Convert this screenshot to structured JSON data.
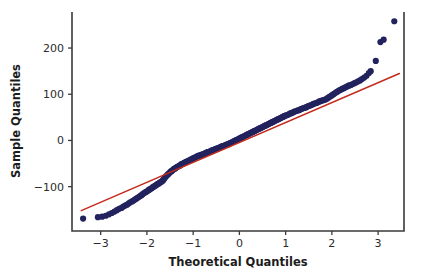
{
  "chart_data": {
    "type": "scatter",
    "title": "",
    "xlabel": "Theoretical Quantiles",
    "ylabel": "Sample Quantiles",
    "xlim": [
      -3.62,
      3.56
    ],
    "ylim": [
      -196,
      278
    ],
    "xticks": [
      -3,
      -2,
      -1,
      0,
      1,
      2,
      3
    ],
    "xticklabels": [
      "−3",
      "−2",
      "−1",
      "0",
      "1",
      "2",
      "3"
    ],
    "yticks": [
      -100,
      0,
      100,
      200
    ],
    "yticklabels": [
      "−100",
      "0",
      "100",
      "200"
    ],
    "grid": false,
    "legend": null,
    "series": [
      {
        "name": "sample-quantiles",
        "kind": "scatter",
        "marker": "circle",
        "marker_size": 5.0,
        "color": "#22225e",
        "points": [
          [
            -3.38,
            -169
          ],
          [
            -3.06,
            -166
          ],
          [
            -2.97,
            -165
          ],
          [
            -2.89,
            -163
          ],
          [
            -2.82,
            -160
          ],
          [
            -2.76,
            -157
          ],
          [
            -2.7,
            -154
          ],
          [
            -2.65,
            -151
          ],
          [
            -2.6,
            -148
          ],
          [
            -2.55,
            -146
          ],
          [
            -2.51,
            -143
          ],
          [
            -2.47,
            -141
          ],
          [
            -2.43,
            -139
          ],
          [
            -2.39,
            -136
          ],
          [
            -2.36,
            -134
          ],
          [
            -2.32,
            -132
          ],
          [
            -2.29,
            -130
          ],
          [
            -2.26,
            -128
          ],
          [
            -2.23,
            -126
          ],
          [
            -2.2,
            -124
          ],
          [
            -2.17,
            -122
          ],
          [
            -2.14,
            -120
          ],
          [
            -2.11,
            -118
          ],
          [
            -2.09,
            -116
          ],
          [
            -2.06,
            -114
          ],
          [
            -2.03,
            -112
          ],
          [
            -2.01,
            -111
          ],
          [
            -1.98,
            -109
          ],
          [
            -1.96,
            -107
          ],
          [
            -1.94,
            -106
          ],
          [
            -1.91,
            -104
          ],
          [
            -1.89,
            -103
          ],
          [
            -1.87,
            -101
          ],
          [
            -1.85,
            -100
          ],
          [
            -1.82,
            -98
          ],
          [
            -1.8,
            -97
          ],
          [
            -1.78,
            -95
          ],
          [
            -1.76,
            -94
          ],
          [
            -1.74,
            -93
          ],
          [
            -1.72,
            -91
          ],
          [
            -1.7,
            -90
          ],
          [
            -1.68,
            -89
          ],
          [
            -1.66,
            -87
          ],
          [
            -1.64,
            -85
          ],
          [
            -1.62,
            -82
          ],
          [
            -1.6,
            -79
          ],
          [
            -1.58,
            -77
          ],
          [
            -1.56,
            -75
          ],
          [
            -1.54,
            -73
          ],
          [
            -1.52,
            -71
          ],
          [
            -1.5,
            -69
          ],
          [
            -1.48,
            -67
          ],
          [
            -1.46,
            -66
          ],
          [
            -1.44,
            -64
          ],
          [
            -1.42,
            -62
          ],
          [
            -1.4,
            -61
          ],
          [
            -1.38,
            -60
          ],
          [
            -1.36,
            -58
          ],
          [
            -1.34,
            -57
          ],
          [
            -1.32,
            -56
          ],
          [
            -1.3,
            -55
          ],
          [
            -1.28,
            -54
          ],
          [
            -1.26,
            -52
          ],
          [
            -1.24,
            -51
          ],
          [
            -1.22,
            -50
          ],
          [
            -1.2,
            -49
          ],
          [
            -1.18,
            -48
          ],
          [
            -1.16,
            -47
          ],
          [
            -1.14,
            -46
          ],
          [
            -1.12,
            -45
          ],
          [
            -1.1,
            -44
          ],
          [
            -1.08,
            -43
          ],
          [
            -1.06,
            -42
          ],
          [
            -1.04,
            -41
          ],
          [
            -1.02,
            -40
          ],
          [
            -1.0,
            -39
          ],
          [
            -0.98,
            -38
          ],
          [
            -0.96,
            -37
          ],
          [
            -0.94,
            -36
          ],
          [
            -0.92,
            -35
          ],
          [
            -0.9,
            -34
          ],
          [
            -0.88,
            -33
          ],
          [
            -0.86,
            -33
          ],
          [
            -0.84,
            -32
          ],
          [
            -0.82,
            -31
          ],
          [
            -0.8,
            -30
          ],
          [
            -0.78,
            -30
          ],
          [
            -0.76,
            -29
          ],
          [
            -0.74,
            -28
          ],
          [
            -0.72,
            -27
          ],
          [
            -0.7,
            -26
          ],
          [
            -0.68,
            -25
          ],
          [
            -0.66,
            -25
          ],
          [
            -0.64,
            -24
          ],
          [
            -0.62,
            -23
          ],
          [
            -0.6,
            -22
          ],
          [
            -0.58,
            -21
          ],
          [
            -0.56,
            -21
          ],
          [
            -0.54,
            -20
          ],
          [
            -0.52,
            -19
          ],
          [
            -0.5,
            -18
          ],
          [
            -0.48,
            -17
          ],
          [
            -0.46,
            -17
          ],
          [
            -0.44,
            -16
          ],
          [
            -0.42,
            -15
          ],
          [
            -0.4,
            -14
          ],
          [
            -0.38,
            -13
          ],
          [
            -0.36,
            -13
          ],
          [
            -0.34,
            -12
          ],
          [
            -0.32,
            -11
          ],
          [
            -0.3,
            -10
          ],
          [
            -0.28,
            -9
          ],
          [
            -0.26,
            -9
          ],
          [
            -0.24,
            -8
          ],
          [
            -0.22,
            -7
          ],
          [
            -0.2,
            -6
          ],
          [
            -0.18,
            -5
          ],
          [
            -0.16,
            -4
          ],
          [
            -0.14,
            -3
          ],
          [
            -0.12,
            -2
          ],
          [
            -0.1,
            -1
          ],
          [
            -0.08,
            0
          ],
          [
            -0.06,
            1
          ],
          [
            -0.04,
            2
          ],
          [
            -0.02,
            3
          ],
          [
            0.0,
            4
          ],
          [
            0.02,
            5
          ],
          [
            0.04,
            6
          ],
          [
            0.06,
            7
          ],
          [
            0.08,
            8
          ],
          [
            0.1,
            9
          ],
          [
            0.12,
            10
          ],
          [
            0.14,
            11
          ],
          [
            0.16,
            12
          ],
          [
            0.18,
            13
          ],
          [
            0.2,
            14
          ],
          [
            0.22,
            15
          ],
          [
            0.24,
            16
          ],
          [
            0.26,
            17
          ],
          [
            0.28,
            18
          ],
          [
            0.3,
            19
          ],
          [
            0.32,
            20
          ],
          [
            0.34,
            21
          ],
          [
            0.36,
            22
          ],
          [
            0.38,
            23
          ],
          [
            0.4,
            24
          ],
          [
            0.42,
            25
          ],
          [
            0.44,
            26
          ],
          [
            0.46,
            27
          ],
          [
            0.48,
            28
          ],
          [
            0.5,
            29
          ],
          [
            0.52,
            30
          ],
          [
            0.54,
            31
          ],
          [
            0.56,
            32
          ],
          [
            0.58,
            33
          ],
          [
            0.6,
            34
          ],
          [
            0.62,
            35
          ],
          [
            0.64,
            36
          ],
          [
            0.66,
            37
          ],
          [
            0.68,
            38
          ],
          [
            0.7,
            39
          ],
          [
            0.72,
            40
          ],
          [
            0.74,
            41
          ],
          [
            0.76,
            42
          ],
          [
            0.78,
            43
          ],
          [
            0.8,
            44
          ],
          [
            0.82,
            45
          ],
          [
            0.84,
            46
          ],
          [
            0.86,
            47
          ],
          [
            0.88,
            48
          ],
          [
            0.9,
            49
          ],
          [
            0.92,
            50
          ],
          [
            0.94,
            51
          ],
          [
            0.96,
            52
          ],
          [
            0.98,
            53
          ],
          [
            1.0,
            54
          ],
          [
            1.03,
            55
          ],
          [
            1.06,
            56
          ],
          [
            1.09,
            58
          ],
          [
            1.12,
            59
          ],
          [
            1.15,
            60
          ],
          [
            1.18,
            62
          ],
          [
            1.21,
            63
          ],
          [
            1.24,
            64
          ],
          [
            1.27,
            65
          ],
          [
            1.3,
            66
          ],
          [
            1.33,
            68
          ],
          [
            1.36,
            69
          ],
          [
            1.39,
            70
          ],
          [
            1.42,
            71
          ],
          [
            1.45,
            72
          ],
          [
            1.48,
            74
          ],
          [
            1.51,
            75
          ],
          [
            1.54,
            76
          ],
          [
            1.57,
            77
          ],
          [
            1.6,
            79
          ],
          [
            1.63,
            80
          ],
          [
            1.66,
            81
          ],
          [
            1.69,
            82
          ],
          [
            1.72,
            84
          ],
          [
            1.75,
            85
          ],
          [
            1.78,
            86
          ],
          [
            1.81,
            87
          ],
          [
            1.84,
            88
          ],
          [
            1.87,
            89
          ],
          [
            1.9,
            91
          ],
          [
            1.93,
            93
          ],
          [
            1.96,
            95
          ],
          [
            1.99,
            97
          ],
          [
            2.02,
            99
          ],
          [
            2.05,
            101
          ],
          [
            2.08,
            103
          ],
          [
            2.11,
            105
          ],
          [
            2.14,
            107
          ],
          [
            2.17,
            109
          ],
          [
            2.2,
            110
          ],
          [
            2.23,
            112
          ],
          [
            2.26,
            113
          ],
          [
            2.29,
            115
          ],
          [
            2.32,
            116
          ],
          [
            2.35,
            118
          ],
          [
            2.38,
            119
          ],
          [
            2.41,
            120
          ],
          [
            2.45,
            122
          ],
          [
            2.49,
            124
          ],
          [
            2.53,
            126
          ],
          [
            2.57,
            128
          ],
          [
            2.61,
            130
          ],
          [
            2.65,
            133
          ],
          [
            2.7,
            136
          ],
          [
            2.75,
            140
          ],
          [
            2.8,
            146
          ],
          [
            2.84,
            150
          ],
          [
            2.95,
            172
          ],
          [
            3.05,
            213
          ],
          [
            3.12,
            218
          ],
          [
            3.35,
            258
          ]
        ]
      },
      {
        "name": "reference-line",
        "kind": "line",
        "color": "#c42b1c",
        "linewidth": 1.5,
        "x": [
          -3.42,
          3.46
        ],
        "y": [
          -152,
          145
        ]
      }
    ],
    "annotations": []
  },
  "figure": {
    "background_color": "#ffffff",
    "axes_background_color": "#ffffff",
    "spine_color": "#3a3a3a",
    "tick_color": "#3a3a3a",
    "tick_label_color": "#2b2b2b",
    "axis_title_color": "#1c1c1c",
    "point_color": "#22225e",
    "line_color": "#c42b1c"
  }
}
